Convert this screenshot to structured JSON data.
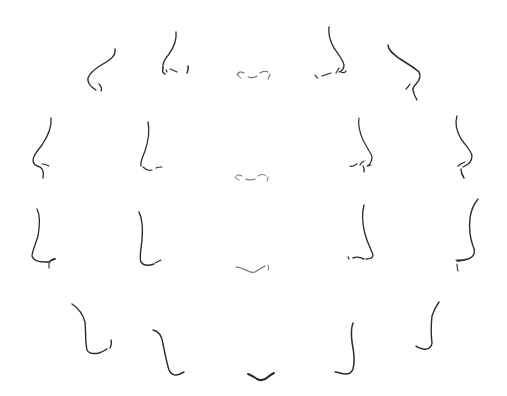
{
  "ink_color": "#2b2b2b",
  "light_ink_color": "#6a6a6a",
  "sketch_count": 20,
  "rows": [
    {
      "row": 1,
      "view": "from below",
      "sketches": [
        {
          "id": "a",
          "angle": "three-quarter left, low"
        },
        {
          "id": "b",
          "angle": "three-quarter left"
        },
        {
          "id": "c",
          "angle": "front, low"
        },
        {
          "id": "d",
          "angle": "three-quarter right"
        },
        {
          "id": "e",
          "angle": "three-quarter right, low"
        }
      ]
    },
    {
      "row": 2,
      "view": "eye level",
      "sketches": [
        {
          "id": "f",
          "angle": "profile left"
        },
        {
          "id": "g",
          "angle": "three-quarter left"
        },
        {
          "id": "h",
          "angle": "front"
        },
        {
          "id": "i",
          "angle": "three-quarter right"
        },
        {
          "id": "j",
          "angle": "profile right"
        }
      ]
    },
    {
      "row": 3,
      "view": "slightly above",
      "sketches": [
        {
          "id": "k",
          "angle": "profile left"
        },
        {
          "id": "l",
          "angle": "three-quarter left"
        },
        {
          "id": "m",
          "angle": "front"
        },
        {
          "id": "n",
          "angle": "three-quarter right"
        },
        {
          "id": "o",
          "angle": "profile right"
        }
      ]
    },
    {
      "row": 4,
      "view": "from above",
      "sketches": [
        {
          "id": "p",
          "angle": "three-quarter left, high"
        },
        {
          "id": "q",
          "angle": "three-quarter left"
        },
        {
          "id": "r",
          "angle": "front, high"
        },
        {
          "id": "s",
          "angle": "three-quarter right"
        },
        {
          "id": "t",
          "angle": "three-quarter right, high"
        }
      ]
    }
  ]
}
